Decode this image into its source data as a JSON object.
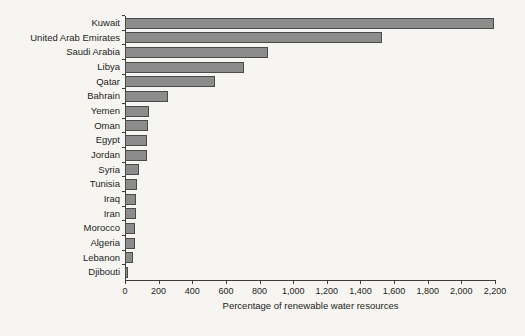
{
  "chart_data": {
    "type": "bar",
    "orientation": "horizontal",
    "title": "",
    "xlabel": "Percentage of renewable water resources",
    "ylabel": "",
    "xlim": [
      0,
      2200
    ],
    "xticks": [
      0,
      200,
      400,
      600,
      800,
      1000,
      1200,
      1400,
      1600,
      1800,
      2000,
      2200
    ],
    "xticklabels": [
      "0",
      "200",
      "400",
      "600",
      "800",
      "1,000",
      "1,200",
      "1,400",
      "1,600",
      "1,800",
      "2,000",
      "2,200"
    ],
    "grid": false,
    "legend": false,
    "bar_color": "#8c8c8c",
    "bar_edge_color": "#4a4a4a",
    "background_color": "#f6f5f1",
    "axis_color": "#3b3b3b",
    "categories": [
      "Kuwait",
      "United Arab Emirates",
      "Saudi Arabia",
      "Libya",
      "Qatar",
      "Bahrain",
      "Yemen",
      "Oman",
      "Egypt",
      "Jordan",
      "Syria",
      "Tunisia",
      "Iraq",
      "Iran",
      "Morocco",
      "Algeria",
      "Lebanon",
      "Djibouti"
    ],
    "values": [
      2195,
      1530,
      850,
      705,
      535,
      255,
      140,
      135,
      133,
      130,
      85,
      72,
      66,
      65,
      58,
      57,
      48,
      18
    ]
  }
}
